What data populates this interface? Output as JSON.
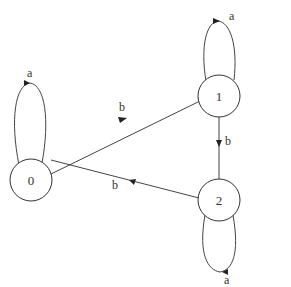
{
  "diagram": {
    "type": "state-machine",
    "nodes": [
      {
        "id": "0",
        "label": "0"
      },
      {
        "id": "1",
        "label": "1"
      },
      {
        "id": "2",
        "label": "2"
      }
    ],
    "edges": [
      {
        "from": "0",
        "to": "0",
        "label": "a"
      },
      {
        "from": "0",
        "to": "1",
        "label": "b"
      },
      {
        "from": "1",
        "to": "1",
        "label": "a"
      },
      {
        "from": "1",
        "to": "2",
        "label": "b"
      },
      {
        "from": "2",
        "to": "0",
        "label": "b"
      },
      {
        "from": "2",
        "to": "2",
        "label": "a"
      }
    ]
  },
  "colors": {
    "stroke": "#333333",
    "background": "#ffffff"
  }
}
